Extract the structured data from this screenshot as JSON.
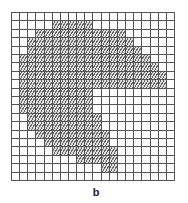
{
  "figure": {
    "label": "b",
    "grid": {
      "rows": 20,
      "cols": 20,
      "line_color": "#555555",
      "fill_style": "diagonal-hatch",
      "hatched_ranges_by_row": [
        null,
        [
          5,
          9
        ],
        [
          3,
          13
        ],
        [
          2,
          14
        ],
        [
          2,
          15
        ],
        [
          1,
          16
        ],
        [
          1,
          17
        ],
        [
          1,
          18
        ],
        [
          1,
          18
        ],
        [
          1,
          9
        ],
        [
          1,
          9
        ],
        [
          1,
          9
        ],
        [
          2,
          10
        ],
        [
          2,
          10
        ],
        [
          3,
          11
        ],
        [
          4,
          11
        ],
        [
          5,
          12
        ],
        [
          8,
          12
        ],
        [
          11,
          12
        ],
        null
      ]
    }
  }
}
